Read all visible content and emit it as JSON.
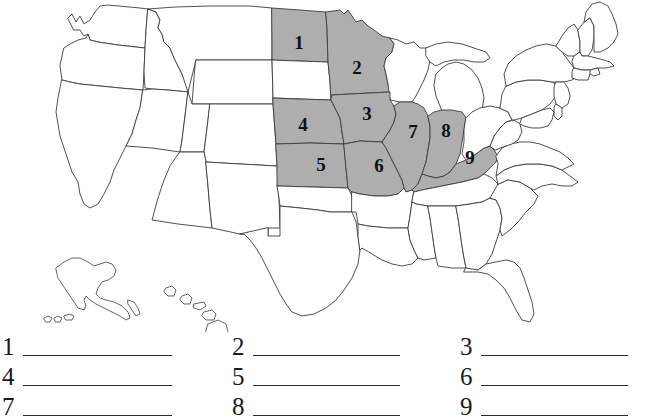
{
  "page": {
    "header_sliver_text": "Identify the states",
    "background_color": "#ffffff",
    "shaded_state_color": "#aeaeae",
    "unshaded_state_color": "#ffffff",
    "outline_color": "#3c3c3c"
  },
  "map": {
    "name": "united-states-outline-map",
    "includes_insets": [
      "Alaska",
      "Hawaii"
    ],
    "numbered_states": [
      {
        "number": "1",
        "x": 299,
        "y": 45
      },
      {
        "number": "2",
        "x": 357,
        "y": 70
      },
      {
        "number": "3",
        "x": 367,
        "y": 116
      },
      {
        "number": "4",
        "x": 303,
        "y": 127
      },
      {
        "number": "5",
        "x": 321,
        "y": 167
      },
      {
        "number": "6",
        "x": 379,
        "y": 168
      },
      {
        "number": "7",
        "x": 413,
        "y": 134
      },
      {
        "number": "8",
        "x": 446,
        "y": 133
      },
      {
        "number": "9",
        "x": 470,
        "y": 160
      }
    ]
  },
  "answers": {
    "rows": [
      {
        "items": [
          {
            "number": "1",
            "value": ""
          },
          {
            "number": "2",
            "value": ""
          },
          {
            "number": "3",
            "value": ""
          }
        ]
      },
      {
        "items": [
          {
            "number": "4",
            "value": ""
          },
          {
            "number": "5",
            "value": ""
          },
          {
            "number": "6",
            "value": ""
          }
        ]
      },
      {
        "items": [
          {
            "number": "7",
            "value": ""
          },
          {
            "number": "8",
            "value": ""
          },
          {
            "number": "9",
            "value": ""
          }
        ]
      }
    ]
  }
}
